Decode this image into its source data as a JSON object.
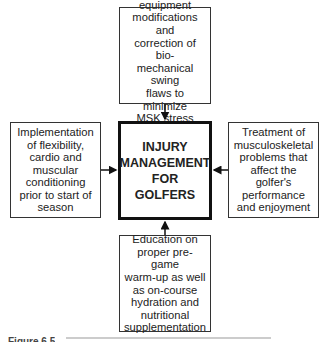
{
  "diagram": {
    "center": {
      "label": "INJURY\nMANAGEMENT\nFOR\nGOLFERS"
    },
    "top": {
      "label": "Appropriate\nequipment\nmodifications and\ncorrection of bio-\nmechanical swing\nflaws to minimize\nMSK stress"
    },
    "left": {
      "label": "Implementation\nof flexibility,\ncardio and\nmuscular\nconditioning\nprior to start of\nseason"
    },
    "right": {
      "label": "Treatment of\nmusculoskeletal\nproblems that\naffect the\ngolfer's\nperformance\nand enjoyment"
    },
    "bottom": {
      "label": "Education on\nproper pre-game\nwarm-up as well\nas on-course\nhydration and\nnutritional\nsupplementation"
    },
    "edges": [
      {
        "from": "top",
        "to": "center"
      },
      {
        "from": "left",
        "to": "center"
      },
      {
        "from": "right",
        "to": "center"
      },
      {
        "from": "bottom",
        "to": "center"
      }
    ]
  },
  "caption": {
    "label": "Figure 6.5"
  }
}
